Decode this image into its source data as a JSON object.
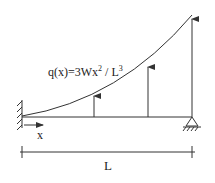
{
  "diagram": {
    "type": "beam-load-diagram",
    "load_label": {
      "prefix": "q(x)=3Wx",
      "exp1": "2",
      "mid": " / L",
      "exp2": "3"
    },
    "axis_label": "x",
    "length_label": "L",
    "left_support": "fixed-wall",
    "right_support": "pin-support",
    "colors": {
      "line": "#333333",
      "background": "#ffffff"
    }
  }
}
